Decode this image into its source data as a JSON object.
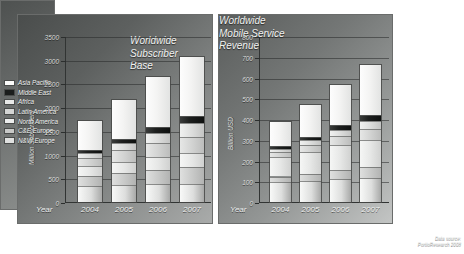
{
  "figure": {
    "source_label": "Data source:",
    "source_value": "PortioResearch 2008"
  },
  "legend": {
    "items": [
      {
        "label": "Asia Pacific",
        "swatch": "#fbfbfa"
      },
      {
        "label": "Middle East",
        "swatch": "#1b1d1c"
      },
      {
        "label": "Africa",
        "swatch": "#e8e9e8"
      },
      {
        "label": "Latin America",
        "swatch": "#d4d5d4"
      },
      {
        "label": "North America",
        "swatch": "#eceded"
      },
      {
        "label": "C&E Europe",
        "swatch": "#c7c8c7"
      },
      {
        "label": "N&W Europe",
        "swatch": "#dfe0df"
      }
    ]
  },
  "chart_data": [
    {
      "id": "subscriber-base",
      "type": "bar",
      "stacked": true,
      "title": "Worldwide\nSubscriber\nBase",
      "xlabel": "Year",
      "ylabel": "Million Subscribers",
      "ylim": [
        0,
        3500
      ],
      "yticks": [
        0,
        500,
        1000,
        1500,
        2000,
        2500,
        3000,
        3500
      ],
      "grid": true,
      "legend_position": "right-external",
      "categories": [
        "2004",
        "2005",
        "2006",
        "2007"
      ],
      "series": [
        {
          "name": "N&W Europe",
          "key": "nwe",
          "values": [
            330,
            350,
            370,
            385
          ]
        },
        {
          "name": "C&E Europe",
          "key": "cee",
          "values": [
            215,
            265,
            315,
            355
          ]
        },
        {
          "name": "North America",
          "key": "na",
          "values": [
            205,
            235,
            265,
            290
          ]
        },
        {
          "name": "Latin America",
          "key": "latam",
          "values": [
            185,
            240,
            300,
            345
          ]
        },
        {
          "name": "Africa",
          "key": "africa",
          "values": [
            95,
            150,
            215,
            290
          ]
        },
        {
          "name": "Middle East",
          "key": "me",
          "values": [
            65,
            85,
            110,
            140
          ]
        },
        {
          "name": "Asia Pacific",
          "key": "asia",
          "values": [
            655,
            860,
            1110,
            1295
          ]
        }
      ],
      "totals": [
        1750,
        2185,
        2685,
        3100
      ]
    },
    {
      "id": "mobile-service-revenue",
      "type": "bar",
      "stacked": true,
      "title": "Worldwide\nMobile Service\nRevenue",
      "xlabel": "Year",
      "ylabel": "Billion USD",
      "ylim": [
        0,
        800
      ],
      "yticks": [
        0,
        100,
        200,
        300,
        400,
        500,
        600,
        700,
        800
      ],
      "grid": true,
      "legend_position": "right-external",
      "categories": [
        "2004",
        "2005",
        "2006",
        "2007"
      ],
      "series": [
        {
          "name": "N&W Europe",
          "key": "nwe",
          "values": [
            95,
            102,
            110,
            116
          ]
        },
        {
          "name": "C&E Europe",
          "key": "cee",
          "values": [
            28,
            35,
            44,
            52
          ]
        },
        {
          "name": "North America",
          "key": "na",
          "values": [
            92,
            105,
            120,
            133
          ]
        },
        {
          "name": "Latin America",
          "key": "latam",
          "values": [
            27,
            34,
            43,
            52
          ]
        },
        {
          "name": "Africa",
          "key": "africa",
          "values": [
            15,
            21,
            29,
            38
          ]
        },
        {
          "name": "Middle East",
          "key": "me",
          "values": [
            14,
            18,
            23,
            29
          ]
        },
        {
          "name": "Asia Pacific",
          "key": "asia",
          "values": [
            124,
            160,
            206,
            250
          ]
        }
      ],
      "totals": [
        395,
        475,
        575,
        670
      ]
    }
  ]
}
